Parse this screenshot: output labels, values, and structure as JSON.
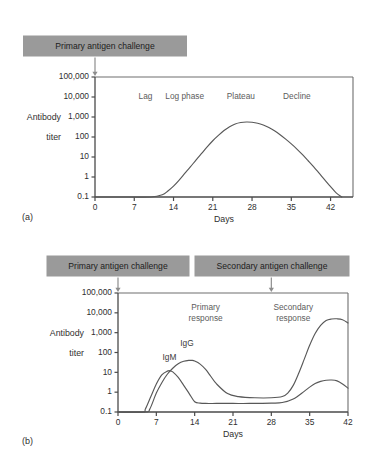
{
  "figure": {
    "background": "#ffffff",
    "banner_color": "#9a9a9a",
    "curve_color": "#585858",
    "axis_color": "#4a4a4a"
  },
  "panel_a": {
    "caption": "(a)",
    "banner": {
      "label": "Primary antigen challenge",
      "arrow_at_day": 0
    },
    "phases": [
      {
        "label": "Lag",
        "day": 9
      },
      {
        "label": "Log phase",
        "day": 16
      },
      {
        "label": "Plateau",
        "day": 26
      },
      {
        "label": "Decline",
        "day": 36
      }
    ]
  },
  "panel_b": {
    "caption": "(b)",
    "banners": [
      {
        "label": "Primary antigen challenge",
        "arrow_at_day": 0
      },
      {
        "label": "Secondary antigen challenge",
        "arrow_at_day": 28
      }
    ],
    "response_labels": [
      {
        "line1": "Primary",
        "line2": "response",
        "day": 16
      },
      {
        "line1": "Secondary",
        "line2": "response",
        "day": 32
      }
    ],
    "curve_labels": [
      {
        "label": "IgM",
        "day": 9.4,
        "titer": 55
      },
      {
        "label": "IgG",
        "day": 12.6,
        "titer": 260
      }
    ]
  },
  "chart_data": [
    {
      "type": "line",
      "panel": "(a)",
      "title": "Primary antibody response over time",
      "xlabel": "Days",
      "ylabel": "Antibody titer",
      "xlim": [
        0,
        46
      ],
      "xticks": [
        0,
        7,
        14,
        21,
        28,
        35,
        42
      ],
      "xticklabels": [
        "0",
        "7",
        "14",
        "21",
        "28",
        "35",
        "42"
      ],
      "yscale": "log",
      "ylim": [
        0.1,
        100000
      ],
      "yticks": [
        0.1,
        1,
        10,
        100,
        1000,
        10000,
        100000
      ],
      "yticklabels": [
        "0.1",
        "1",
        "10",
        "100",
        "1,000",
        "10,000",
        "100,000"
      ],
      "grid": false,
      "legend": false,
      "annotations": [
        "Lag",
        "Log phase",
        "Plateau",
        "Decline",
        "Primary antigen challenge"
      ],
      "series": [
        {
          "name": "Antibody titer",
          "x": [
            0,
            6,
            10,
            12,
            13,
            14,
            15,
            16,
            17,
            18,
            19,
            20,
            21,
            22,
            23,
            24,
            25,
            26,
            27,
            28,
            29,
            30,
            31,
            32,
            33,
            34,
            35,
            36,
            37,
            38,
            39,
            40,
            41,
            42,
            43,
            44
          ],
          "y": [
            0.1,
            0.1,
            0.1,
            0.13,
            0.2,
            0.35,
            0.7,
            1.5,
            3.2,
            7,
            15,
            32,
            65,
            120,
            210,
            330,
            450,
            530,
            560,
            545,
            490,
            400,
            300,
            205,
            130,
            78,
            45,
            25,
            13,
            6.5,
            3.2,
            1.5,
            0.7,
            0.33,
            0.16,
            0.1
          ]
        }
      ]
    },
    {
      "type": "line",
      "panel": "(b)",
      "title": "Primary and secondary antibody responses",
      "xlabel": "Days",
      "ylabel": "Antibody titer",
      "xlim": [
        0,
        42
      ],
      "xticks": [
        0,
        7,
        14,
        21,
        28,
        35,
        42
      ],
      "xticklabels": [
        "0",
        "7",
        "14",
        "21",
        "28",
        "35",
        "42"
      ],
      "yscale": "log",
      "ylim": [
        0.1,
        100000
      ],
      "yticks": [
        0.1,
        1,
        10,
        100,
        1000,
        10000,
        100000
      ],
      "yticklabels": [
        "0.1",
        "1",
        "10",
        "100",
        "1,000",
        "10,000",
        "100,000"
      ],
      "grid": false,
      "legend": false,
      "annotations": [
        "Primary response",
        "Secondary response",
        "IgM",
        "IgG",
        "Primary antigen challenge",
        "Secondary antigen challenge"
      ],
      "series": [
        {
          "name": "IgM",
          "x": [
            0,
            4.5,
            5,
            6,
            7,
            8,
            9,
            9.5,
            10,
            11,
            12,
            13,
            14,
            15,
            16,
            18,
            21,
            24,
            28,
            30,
            32,
            34,
            35,
            36,
            37,
            38,
            39,
            40,
            41,
            42
          ],
          "y": [
            0.1,
            0.1,
            0.14,
            0.6,
            2.6,
            7.5,
            11.5,
            12,
            10.5,
            5.5,
            2.2,
            0.85,
            0.33,
            0.28,
            0.27,
            0.27,
            0.27,
            0.27,
            0.28,
            0.3,
            0.45,
            1.1,
            1.8,
            2.7,
            3.5,
            4,
            4.1,
            3.7,
            2.6,
            1.6
          ]
        },
        {
          "name": "IgG",
          "x": [
            0,
            5,
            5.8,
            7,
            8,
            9,
            10,
            11,
            12,
            13,
            13.5,
            14,
            15,
            16,
            17,
            18,
            20,
            22,
            25,
            28,
            30,
            31,
            32,
            33,
            34,
            35,
            36,
            37,
            38,
            39,
            40,
            41,
            42
          ],
          "y": [
            0.1,
            0.1,
            0.14,
            0.9,
            3.0,
            8.0,
            16,
            27,
            36,
            40,
            40,
            37,
            26,
            14,
            6.0,
            2.6,
            0.85,
            0.6,
            0.52,
            0.52,
            0.6,
            0.9,
            2.2,
            9,
            45,
            230,
            900,
            2300,
            4100,
            4900,
            5000,
            4500,
            3100
          ]
        }
      ]
    }
  ]
}
